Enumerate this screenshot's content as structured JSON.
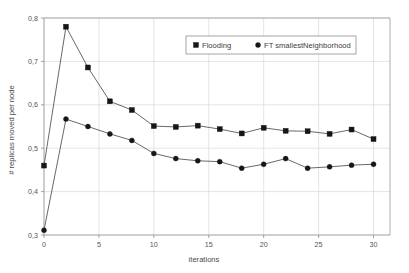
{
  "chart_data": {
    "type": "line",
    "title": "",
    "xlabel": "iterations",
    "ylabel": "# replicas moved per node",
    "xlim": [
      0,
      31.5
    ],
    "ylim": [
      0.3,
      0.8
    ],
    "grid": true,
    "legend_position": "top-center",
    "x": [
      0,
      2,
      4,
      6,
      8,
      10,
      12,
      14,
      16,
      18,
      20,
      22,
      24,
      26,
      28,
      30
    ],
    "xticks": [
      "0",
      "5",
      "10",
      "15",
      "20",
      "25",
      "30"
    ],
    "xtick_values": [
      0,
      5,
      10,
      15,
      20,
      25,
      30
    ],
    "yticks": [
      "0,3",
      "0,4",
      "0,5",
      "0,6",
      "0,7",
      "0,8"
    ],
    "ytick_values": [
      0.3,
      0.4,
      0.5,
      0.6,
      0.7,
      0.8
    ],
    "series": [
      {
        "name": "Flooding",
        "marker": "square",
        "color": "#161616",
        "values": [
          0.46,
          0.78,
          0.686,
          0.608,
          0.588,
          0.551,
          0.549,
          0.552,
          0.544,
          0.534,
          0.547,
          0.54,
          0.539,
          0.533,
          0.543,
          0.521
        ]
      },
      {
        "name": "FT smallestNeighborhood",
        "marker": "circle",
        "color": "#161616",
        "values": [
          0.311,
          0.567,
          0.55,
          0.533,
          0.518,
          0.488,
          0.476,
          0.471,
          0.469,
          0.454,
          0.463,
          0.476,
          0.454,
          0.457,
          0.461,
          0.463
        ]
      }
    ]
  },
  "legend": {
    "items": [
      {
        "label": "Flooding",
        "marker": "square"
      },
      {
        "label": "FT smallestNeighborhood",
        "marker": "circle"
      }
    ]
  }
}
